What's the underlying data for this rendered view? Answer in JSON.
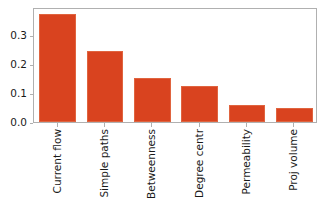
{
  "chart_data": {
    "type": "bar",
    "title": "",
    "xlabel": "",
    "ylabel": "",
    "categories": [
      "Current flow",
      "Simple paths",
      "Betweenness",
      "Degree centr",
      "Permeability",
      "Proj volume"
    ],
    "values": [
      0.372,
      0.245,
      0.152,
      0.123,
      0.06,
      0.05
    ],
    "ylim": [
      0.0,
      0.397
    ],
    "yticks": [
      0.0,
      0.1,
      0.2,
      0.3
    ],
    "ytick_labels": [
      "0.0",
      "0.1",
      "0.2",
      "0.3"
    ],
    "grid": false,
    "legend": null,
    "bar_color": "#d9431f",
    "bar_edge_color": "#e0643f",
    "axis_color": "#b0b0b0",
    "text_color": "#1a1a1a",
    "background": "#ffffff",
    "xtick_rotation": -90
  }
}
